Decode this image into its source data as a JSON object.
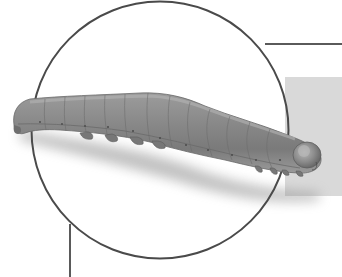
{
  "image": {
    "subject": "caterpillar",
    "description": "Grayscale illustration of a caterpillar (larva) lying horizontally inside a thin circular outline frame, with a gray rectangular panel on the right and connector lines extending from the circle.",
    "colors": {
      "background": "#ffffff",
      "circle_stroke": "#4a4a4a",
      "connector_lines": "#5a5a5a",
      "gray_panel": "#d9d9d9",
      "caterpillar_body": "#8a8a8a",
      "caterpillar_dark": "#5e5e5e",
      "caterpillar_light": "#b0b0b0",
      "shadow": "#9a9a9a"
    },
    "elements": {
      "circle": {
        "cx": 160,
        "cy": 130,
        "r": 129
      },
      "top_right_line": {
        "x1": 265,
        "y": 44,
        "x2": 342
      },
      "bottom_left_line": {
        "x": 70,
        "y1": 225,
        "y2": 277
      },
      "gray_panel": {
        "x": 285,
        "y": 77,
        "width": 57,
        "height": 119
      }
    }
  }
}
